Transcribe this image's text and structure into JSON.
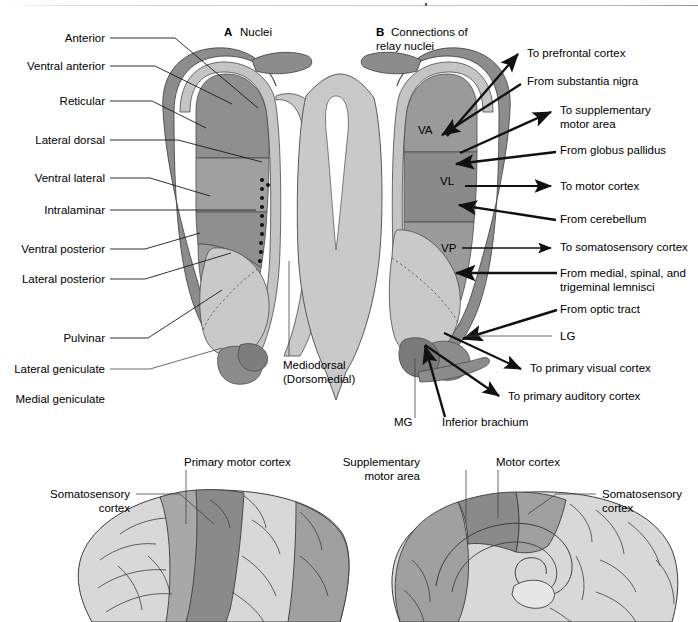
{
  "figure": {
    "panels": [
      {
        "letter": "A",
        "title": "Nuclei"
      },
      {
        "letter": "B",
        "title_line1": "Connections of",
        "title_line2": "relay nuclei"
      }
    ],
    "left_labels": [
      {
        "id": "anterior",
        "text": "Anterior"
      },
      {
        "id": "ventral-anterior",
        "text": "Ventral anterior"
      },
      {
        "id": "reticular",
        "text": "Reticular"
      },
      {
        "id": "lateral-dorsal",
        "text": "Lateral dorsal"
      },
      {
        "id": "ventral-lateral",
        "text": "Ventral lateral"
      },
      {
        "id": "intralaminar",
        "text": "Intralaminar"
      },
      {
        "id": "ventral-posterior",
        "text": "Ventral posterior"
      },
      {
        "id": "lateral-posterior",
        "text": "Lateral posterior"
      },
      {
        "id": "pulvinar",
        "text": "Pulvinar"
      },
      {
        "id": "lateral-geniculate",
        "text": "Lateral geniculate"
      },
      {
        "id": "medial-geniculate",
        "text": "Medial geniculate"
      }
    ],
    "center_label": {
      "line1": "Mediodorsal",
      "line2": "(Dorsomedial)"
    },
    "right_labels": [
      {
        "id": "to-prefrontal-cortex",
        "text": "To prefrontal cortex"
      },
      {
        "id": "from-substantia-nigra",
        "text": "From substantia nigra"
      },
      {
        "id": "to-supplementary-motor-area",
        "line1": "To supplementary",
        "line2": "motor area"
      },
      {
        "id": "from-globus-pallidus",
        "text": "From globus pallidus"
      },
      {
        "id": "to-motor-cortex",
        "text": "To motor cortex"
      },
      {
        "id": "from-cerebellum",
        "text": "From cerebellum"
      },
      {
        "id": "to-somatosensory-cortex",
        "text": "To somatosensory cortex"
      },
      {
        "id": "from-lemnisci",
        "line1": "From medial, spinal, and",
        "line2": "trigeminal lemnisci"
      },
      {
        "id": "from-optic-tract",
        "text": "From optic tract"
      },
      {
        "id": "lg",
        "text": "LG"
      },
      {
        "id": "to-primary-visual-cortex",
        "text": "To primary visual cortex"
      },
      {
        "id": "to-primary-auditory-cortex",
        "text": "To primary auditory cortex"
      }
    ],
    "nuclei_abbrevs": [
      {
        "id": "va",
        "text": "VA"
      },
      {
        "id": "vl",
        "text": "VL"
      },
      {
        "id": "vp",
        "text": "VP"
      },
      {
        "id": "mg",
        "text": "MG"
      }
    ],
    "bottom_labels": [
      {
        "id": "inferior-brachium",
        "text": "Inferior brachium"
      }
    ],
    "brain_left": {
      "label_somatosensory_line1": "Somatosensory",
      "label_somatosensory_line2": "cortex",
      "label_primary_motor": "Primary motor cortex"
    },
    "brain_right": {
      "label_supplementary_line1": "Supplementary",
      "label_supplementary_line2": "motor area",
      "label_motor_cortex": "Motor cortex",
      "label_somatosensory_line1": "Somatosensory",
      "label_somatosensory_line2": "cortex"
    },
    "colors": {
      "capsule_dark": "#8c8c8c",
      "nucleus_light": "#c9c9c9",
      "nucleus_mid": "#b0b0b0",
      "nucleus_dark": "#969696",
      "nucleus_darkest": "#808080",
      "background": "#ffffff",
      "outline": "#4a4a4a",
      "text": "#000000",
      "brain_light": "#d8d8d8",
      "brain_mid": "#a8a8a8",
      "brain_dark": "#8a8a8a"
    }
  }
}
